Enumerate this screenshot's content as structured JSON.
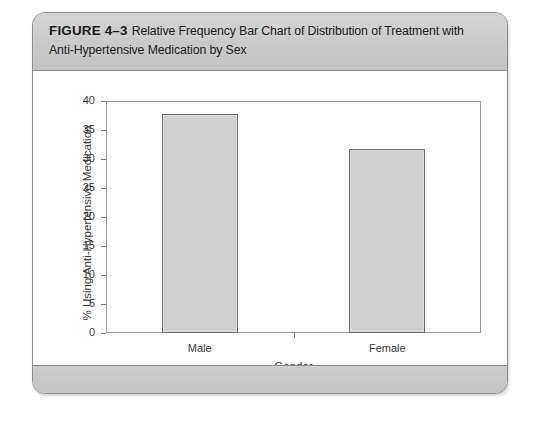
{
  "figure": {
    "label": "FIGURE 4–3",
    "caption": "Relative Frequency Bar Chart of Distribution of Treatment with Anti-Hypertensive Medication by Sex"
  },
  "chart_data": {
    "type": "bar",
    "title": "",
    "categories": [
      "Male",
      "Female"
    ],
    "values": [
      37.8,
      31.8
    ],
    "xlabel": "Gender",
    "ylabel": "% Using Anti-Hypertensive Medication",
    "ylim": [
      0,
      40
    ],
    "yticks": [
      0,
      5,
      10,
      15,
      20,
      25,
      30,
      35,
      40
    ],
    "ytick_labels": [
      "0",
      "5",
      "10",
      "15",
      "20",
      "25",
      "30",
      "35",
      "40"
    ],
    "grid": false,
    "legend": null,
    "bar_fill_color": "#cfcfcf",
    "bar_border_color": "#6f6f6f",
    "axis_color": "#9b9b9b"
  },
  "colors": {
    "panel_border": "#8d8d8d",
    "caption_band": "#cacaca",
    "footer_band": "#c7c7c7",
    "page_background": "#ffffff",
    "text": "#1c1c1c"
  }
}
